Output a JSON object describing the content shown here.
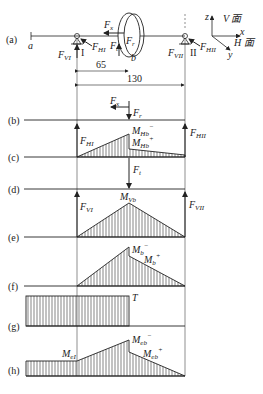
{
  "figure": {
    "panels": {
      "a": {
        "tag": "(a)",
        "point_a": "a",
        "support_1": "I",
        "support_2": "II",
        "point_b": "b",
        "dim_1": "65",
        "dim_2": "130",
        "labels": {
          "Fx": "F",
          "Fx_sub": "x",
          "Fr": "F",
          "Fr_sub": "r",
          "Ft": "F",
          "Ft_sub": "t",
          "FVI": "F",
          "FVI_sub": "VI",
          "FHI": "F",
          "FHI_sub": "HI",
          "FVII": "F",
          "FVII_sub": "VII",
          "FHII": "F",
          "FHII_sub": "HII"
        },
        "axes": {
          "z": "z",
          "x": "x",
          "y": "y",
          "v_plane": "V 面",
          "h_plane": "H 面"
        }
      },
      "b": {
        "tag": "(b)",
        "Fx": "F",
        "Fx_sub": "x",
        "Fr": "F",
        "Fr_sub": "r"
      },
      "c": {
        "tag": "(c)",
        "FHI": "F",
        "FHI_sub": "HI",
        "FHII": "F",
        "FHII_sub": "HII",
        "M_minus": "M",
        "M_minus_sub": "Hb",
        "M_minus_sup": "−",
        "M_plus": "M",
        "M_plus_sub": "Hb",
        "M_plus_sup": "+"
      },
      "d": {
        "tag": "(d)",
        "Ft": "F",
        "Ft_sub": "t"
      },
      "e": {
        "tag": "(e)",
        "FVI": "F",
        "FVI_sub": "VI",
        "FVII": "F",
        "FVII_sub": "VII",
        "M": "M",
        "M_sub": "Vb"
      },
      "f": {
        "tag": "(f)",
        "M_minus": "M",
        "M_minus_sub": "b",
        "M_minus_sup": "−",
        "M_plus": "M",
        "M_plus_sub": "b",
        "M_plus_sup": "+"
      },
      "g": {
        "tag": "(g)",
        "T": "T"
      },
      "h": {
        "tag": "(h)",
        "M_I": "M",
        "M_I_sub": "eI",
        "M_minus": "M",
        "M_minus_sub": "eb",
        "M_minus_sup": "−",
        "M_plus": "M",
        "M_plus_sub": "eb",
        "M_plus_sup": "+"
      }
    }
  }
}
